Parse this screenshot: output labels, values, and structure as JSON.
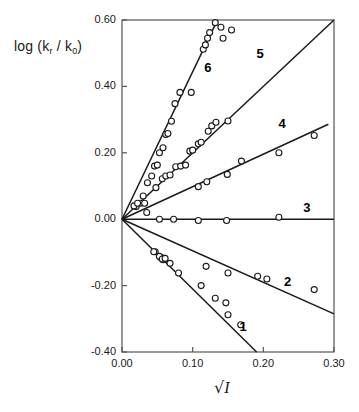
{
  "chart_data": {
    "type": "scatter",
    "title": "",
    "xlabel": "√I",
    "ylabel": "log (kᵣ / k₀)",
    "ylabel_parts": {
      "prefix": "log (k",
      "sub1": "r",
      "mid": " / k",
      "sub2": "0",
      "suffix": ")"
    },
    "xlim": [
      0.0,
      0.3
    ],
    "ylim": [
      -0.4,
      0.6
    ],
    "xticks": [
      0.0,
      0.1,
      0.2,
      0.3
    ],
    "xtick_labels": [
      "0.00",
      "0.10",
      "0.20",
      "0.30"
    ],
    "yticks": [
      -0.4,
      -0.2,
      0.0,
      0.2,
      0.4,
      0.6
    ],
    "ytick_labels": [
      "-0.40",
      "-0.20",
      "0.00",
      "0.20",
      "0.40",
      "0.60"
    ],
    "grid": false,
    "legend_position": "inline-labels",
    "marker": "open-circle",
    "line_color": "#1a1a1a",
    "marker_color": "#1a1a1a",
    "axis_color": "#555555",
    "series": [
      {
        "name": "1",
        "label": "1",
        "label_x": 0.172,
        "label_y": -0.325,
        "slope": -2.1,
        "intercept": 0.0,
        "fit_x": [
          0.0,
          0.1905
        ],
        "points": [
          {
            "x": 0.047,
            "y": -0.098
          },
          {
            "x": 0.055,
            "y": -0.115
          },
          {
            "x": 0.058,
            "y": -0.122
          },
          {
            "x": 0.06,
            "y": -0.118
          },
          {
            "x": 0.068,
            "y": -0.133
          },
          {
            "x": 0.08,
            "y": -0.162
          },
          {
            "x": 0.112,
            "y": -0.2
          },
          {
            "x": 0.132,
            "y": -0.238
          },
          {
            "x": 0.147,
            "y": -0.252
          },
          {
            "x": 0.15,
            "y": -0.288
          },
          {
            "x": 0.168,
            "y": -0.318
          }
        ]
      },
      {
        "name": "2",
        "label": "2",
        "label_x": 0.235,
        "label_y": -0.19,
        "slope": -0.95,
        "intercept": 0.0,
        "fit_x": [
          0.0,
          0.3
        ],
        "points": [
          {
            "x": 0.045,
            "y": -0.098
          },
          {
            "x": 0.053,
            "y": -0.112
          },
          {
            "x": 0.057,
            "y": -0.12
          },
          {
            "x": 0.061,
            "y": -0.118
          },
          {
            "x": 0.119,
            "y": -0.142
          },
          {
            "x": 0.15,
            "y": -0.162
          },
          {
            "x": 0.192,
            "y": -0.172
          },
          {
            "x": 0.205,
            "y": -0.18
          },
          {
            "x": 0.272,
            "y": -0.212
          }
        ]
      },
      {
        "name": "3",
        "label": "3",
        "label_x": 0.262,
        "label_y": 0.035,
        "slope": 0.0,
        "intercept": 0.0,
        "fit_x": [
          0.0,
          0.3
        ],
        "points": [
          {
            "x": 0.053,
            "y": 0.0
          },
          {
            "x": 0.073,
            "y": 0.0
          },
          {
            "x": 0.108,
            "y": -0.004
          },
          {
            "x": 0.148,
            "y": -0.004
          },
          {
            "x": 0.222,
            "y": 0.006
          }
        ]
      },
      {
        "name": "4",
        "label": "4",
        "label_x": 0.227,
        "label_y": 0.288,
        "slope": 0.98,
        "intercept": 0.0,
        "fit_x": [
          0.0,
          0.292
        ],
        "points": [
          {
            "x": 0.035,
            "y": 0.02
          },
          {
            "x": 0.108,
            "y": 0.098
          },
          {
            "x": 0.12,
            "y": 0.113
          },
          {
            "x": 0.149,
            "y": 0.135
          },
          {
            "x": 0.169,
            "y": 0.175
          },
          {
            "x": 0.222,
            "y": 0.2
          },
          {
            "x": 0.272,
            "y": 0.252
          }
        ]
      },
      {
        "name": "5",
        "label": "5",
        "label_x": 0.196,
        "label_y": 0.497,
        "slope": 2.0,
        "intercept": 0.0,
        "fit_x": [
          0.0,
          0.3
        ],
        "points": [
          {
            "x": 0.02,
            "y": 0.038
          },
          {
            "x": 0.026,
            "y": 0.048
          },
          {
            "x": 0.032,
            "y": 0.048
          },
          {
            "x": 0.048,
            "y": 0.095
          },
          {
            "x": 0.057,
            "y": 0.122
          },
          {
            "x": 0.062,
            "y": 0.13
          },
          {
            "x": 0.068,
            "y": 0.133
          },
          {
            "x": 0.076,
            "y": 0.158
          },
          {
            "x": 0.083,
            "y": 0.16
          },
          {
            "x": 0.09,
            "y": 0.163
          },
          {
            "x": 0.096,
            "y": 0.205
          },
          {
            "x": 0.1,
            "y": 0.208
          },
          {
            "x": 0.108,
            "y": 0.227
          },
          {
            "x": 0.112,
            "y": 0.232
          },
          {
            "x": 0.122,
            "y": 0.265
          },
          {
            "x": 0.127,
            "y": 0.281
          },
          {
            "x": 0.133,
            "y": 0.292
          },
          {
            "x": 0.15,
            "y": 0.296
          }
        ]
      },
      {
        "name": "6",
        "label": "6",
        "label_x": 0.122,
        "label_y": 0.455,
        "slope": 4.44,
        "intercept": 0.0,
        "fit_x": [
          0.0,
          0.135
        ],
        "points": [
          {
            "x": 0.017,
            "y": 0.04
          },
          {
            "x": 0.022,
            "y": 0.048
          },
          {
            "x": 0.03,
            "y": 0.07
          },
          {
            "x": 0.036,
            "y": 0.11
          },
          {
            "x": 0.042,
            "y": 0.13
          },
          {
            "x": 0.046,
            "y": 0.16
          },
          {
            "x": 0.05,
            "y": 0.163
          },
          {
            "x": 0.053,
            "y": 0.2
          },
          {
            "x": 0.058,
            "y": 0.215
          },
          {
            "x": 0.062,
            "y": 0.255
          },
          {
            "x": 0.065,
            "y": 0.258
          },
          {
            "x": 0.07,
            "y": 0.295
          },
          {
            "x": 0.075,
            "y": 0.348
          },
          {
            "x": 0.082,
            "y": 0.382
          },
          {
            "x": 0.098,
            "y": 0.382
          },
          {
            "x": 0.115,
            "y": 0.512
          },
          {
            "x": 0.118,
            "y": 0.525
          },
          {
            "x": 0.121,
            "y": 0.545
          },
          {
            "x": 0.124,
            "y": 0.562
          },
          {
            "x": 0.132,
            "y": 0.592
          },
          {
            "x": 0.14,
            "y": 0.578
          },
          {
            "x": 0.143,
            "y": 0.545
          },
          {
            "x": 0.155,
            "y": 0.57
          }
        ]
      }
    ]
  }
}
